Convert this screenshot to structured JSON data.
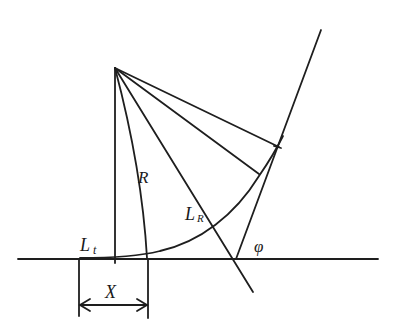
{
  "diagram": {
    "stroke_color": "#1e1e1e",
    "background": "#ffffff",
    "labels": {
      "R": "R",
      "L_main": "L",
      "L_sub_R": "R",
      "Lt_main": "L",
      "Lt_sub": "t",
      "phi": "φ",
      "X": "X"
    },
    "points": {
      "center": [
        115,
        68
      ],
      "baseline_start": [
        18,
        259
      ],
      "baseline_end": [
        378,
        259
      ],
      "incline_foot": [
        236,
        259
      ],
      "incline_top": [
        321,
        30
      ],
      "tangent_point_t": [
        148,
        257
      ],
      "dimension_left_x": 79,
      "dimension_right_x": 148
    }
  }
}
